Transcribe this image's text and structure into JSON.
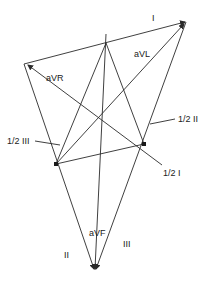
{
  "diagram": {
    "labels": {
      "lead_I": "I",
      "lead_II": "II",
      "lead_III": "III",
      "aVR": "aVR",
      "aVL": "aVL",
      "aVF": "aVF",
      "half_I": "1/2 I",
      "half_II": "1/2 II",
      "half_III": "1/2 III"
    },
    "colors": {
      "line": "#2a2a2a",
      "text": "#222222",
      "background": "#ffffff"
    }
  }
}
